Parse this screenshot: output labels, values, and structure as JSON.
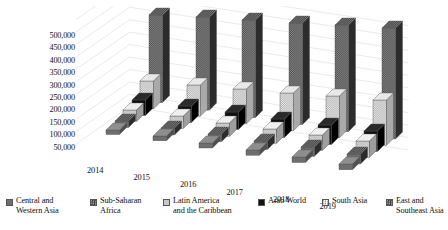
{
  "chart_data": {
    "type": "bar",
    "title": "",
    "xlabel": "",
    "ylabel": "",
    "categories": [
      "2014",
      "2015",
      "2016",
      "2017",
      "2018",
      "2019"
    ],
    "ylim": [
      0,
      500000
    ],
    "yticks": [
      "50,000",
      "100,000",
      "150,000",
      "200,000",
      "250,000",
      "300,000",
      "350,000",
      "400,000",
      "450,000",
      "500,000"
    ],
    "ytick_values": [
      50000,
      100000,
      150000,
      200000,
      250000,
      300000,
      350000,
      400000,
      450000,
      500000
    ],
    "grid": true,
    "legend_position": "bottom",
    "three_d": true,
    "series": [
      {
        "name": "Central and Western Asia",
        "label": "Central and\nWestern Asia",
        "pattern": "solid-dark-gray",
        "color": "#6e6e6e",
        "values": [
          18000,
          19000,
          20000,
          21000,
          22000,
          23000
        ]
      },
      {
        "name": "Sub-Saharan Africa",
        "label": "Sub-Saharan\nAfrica",
        "pattern": "checker-dark",
        "color": "#4a4a4a",
        "values": [
          26000,
          28000,
          31000,
          34000,
          37000,
          40000
        ]
      },
      {
        "name": "Latin America and the Caribbean",
        "label": "Latin America\nand the Caribbean",
        "pattern": "solid-light-gray",
        "color": "#c9c9c9",
        "values": [
          47000,
          50000,
          54000,
          58000,
          62000,
          66000
        ]
      },
      {
        "name": "Arab World",
        "label": "Arab World",
        "pattern": "solid-black",
        "color": "#111111",
        "values": [
          62000,
          66000,
          70000,
          74000,
          78000,
          82000
        ]
      },
      {
        "name": "South Asia",
        "label": "South Asia",
        "pattern": "checker-light",
        "color": "#d2d2d2",
        "values": [
          112000,
          125000,
          140000,
          152000,
          168000,
          182000
        ]
      },
      {
        "name": "East and Southeast Asia",
        "label": "East and\nSoutheast Asia",
        "pattern": "checker-dark",
        "color": "#555555",
        "values": [
          352000,
          374000,
          392000,
          408000,
          428000,
          446000
        ]
      }
    ]
  },
  "legend": {
    "items": [
      {
        "label": "Central and\nWestern Asia"
      },
      {
        "label": "Sub-Saharan\nAfrica"
      },
      {
        "label": "Latin America\nand the Caribbean"
      },
      {
        "label": "Arab World"
      },
      {
        "label": "South Asia"
      },
      {
        "label": "East and\nSoutheast Asia"
      }
    ]
  }
}
